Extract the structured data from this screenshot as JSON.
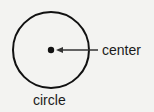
{
  "diagram": {
    "shape": "circle",
    "labels": {
      "center": "center",
      "circle": "circle"
    },
    "colors": {
      "stroke": "#111111",
      "text": "#1a1a1a",
      "background": "#f3f3f1"
    }
  }
}
